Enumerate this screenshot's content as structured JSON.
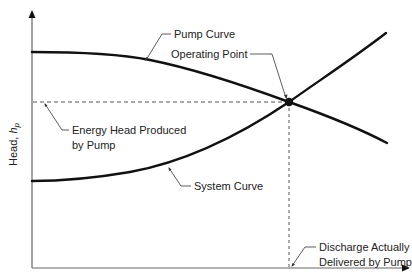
{
  "diagram": {
    "axes": {
      "y_label": "Head, ",
      "y_label_var": "h",
      "y_label_sub": "p",
      "x_label": ""
    },
    "labels": {
      "pump_curve": "Pump Curve",
      "operating_point": "Operating Point",
      "energy_head_line1": "Energy Head Produced",
      "energy_head_line2": "by Pump",
      "system_curve": "System Curve",
      "discharge_line1": "Discharge Actually",
      "discharge_line2": "Delivered by Pump"
    },
    "colors": {
      "curve": "#111111",
      "axis": "#555555",
      "dashed": "#444444",
      "text": "#222222"
    }
  }
}
